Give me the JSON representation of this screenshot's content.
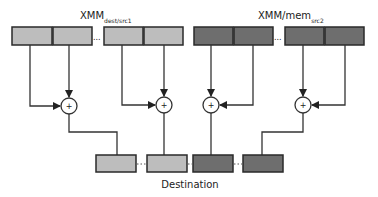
{
  "diagram": {
    "src1_label": "XMM",
    "src1_sub": "dest/src1",
    "src2_label": "XMM/mem",
    "src2_sub": "src2",
    "dest_label": "Destination",
    "op_symbol": "+",
    "ellipsis": "...",
    "colors": {
      "src1_fill": "#bdbdbd",
      "src2_fill": "#6e6e6e",
      "border": "#2a2a2a",
      "line": "#333333"
    }
  }
}
